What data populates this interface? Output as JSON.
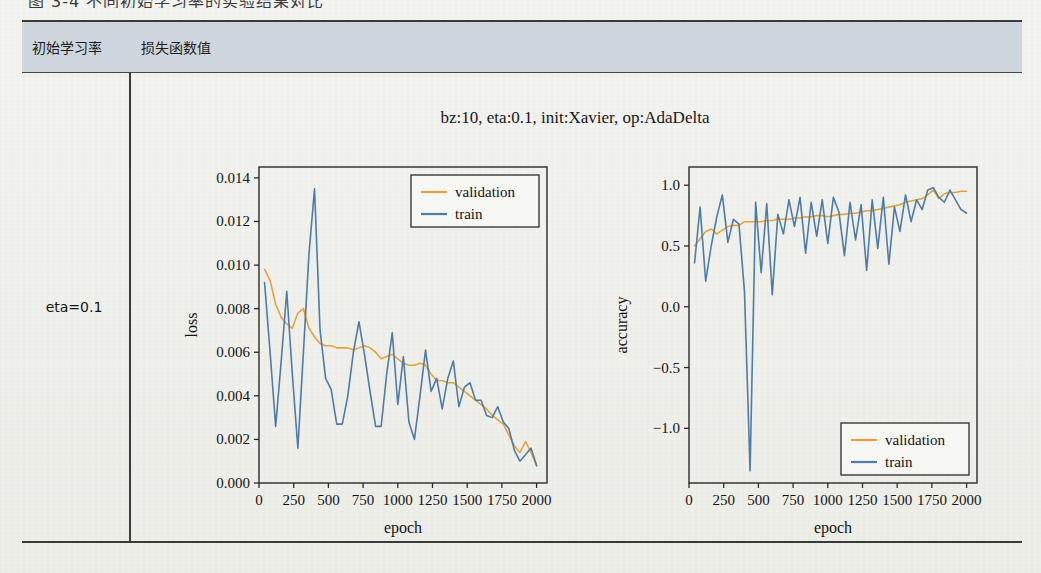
{
  "caption_partial": "图 3-4  不同初始学习率的实验结果对比",
  "table": {
    "headers": [
      "初始学习率",
      "损失函数值"
    ],
    "row_label": "eta=0.1"
  },
  "figure": {
    "title": "bz:10, eta:0.1, init:Xavier, op:AdaDelta"
  },
  "colors": {
    "validation": "#e3a33c",
    "train": "#4e7ca8",
    "header_bg": "#ccd6dc",
    "rule": "#3a3a3a",
    "page_bg": "#f2f2ee"
  },
  "chart_data": [
    {
      "type": "line",
      "id": "loss-chart",
      "title": "",
      "xlabel": "epoch",
      "ylabel": "loss",
      "xlim": [
        0,
        2075
      ],
      "ylim": [
        0,
        0.0145
      ],
      "xticks": [
        0,
        250,
        500,
        750,
        1000,
        1250,
        1500,
        1750,
        2000
      ],
      "yticks": [
        0.0,
        0.002,
        0.004,
        0.006,
        0.008,
        0.01,
        0.012,
        0.014
      ],
      "ytick_labels": [
        "0.000",
        "0.002",
        "0.004",
        "0.006",
        "0.008",
        "0.010",
        "0.012",
        "0.014"
      ],
      "grid": false,
      "legend_position": "upper-right",
      "legend": [
        "validation",
        "train"
      ],
      "x": [
        40,
        80,
        120,
        160,
        200,
        240,
        280,
        320,
        360,
        400,
        440,
        480,
        520,
        560,
        600,
        640,
        680,
        720,
        760,
        800,
        840,
        880,
        920,
        960,
        1000,
        1040,
        1080,
        1120,
        1160,
        1200,
        1240,
        1280,
        1320,
        1360,
        1400,
        1440,
        1480,
        1520,
        1560,
        1600,
        1640,
        1680,
        1720,
        1760,
        1800,
        1840,
        1880,
        1920,
        1960,
        2000
      ],
      "series": [
        {
          "name": "validation",
          "color": "#e3a33c",
          "values": [
            0.0098,
            0.0093,
            0.0082,
            0.0076,
            0.0073,
            0.0071,
            0.0078,
            0.008,
            0.0071,
            0.0067,
            0.0064,
            0.0063,
            0.0063,
            0.0062,
            0.0062,
            0.0062,
            0.0061,
            0.0062,
            0.0063,
            0.0062,
            0.006,
            0.0057,
            0.0058,
            0.0059,
            0.0057,
            0.0055,
            0.0054,
            0.0054,
            0.0055,
            0.0054,
            0.005,
            0.0047,
            0.0047,
            0.0046,
            0.0046,
            0.0044,
            0.0042,
            0.004,
            0.0038,
            0.0036,
            0.0034,
            0.0031,
            0.0029,
            0.0027,
            0.0022,
            0.0017,
            0.0014,
            0.0019,
            0.0014,
            0.0008
          ]
        },
        {
          "name": "train",
          "color": "#4e7ca8",
          "values": [
            0.0092,
            0.006,
            0.0026,
            0.0056,
            0.0088,
            0.005,
            0.0016,
            0.006,
            0.0105,
            0.0135,
            0.007,
            0.0048,
            0.0043,
            0.0027,
            0.0027,
            0.004,
            0.006,
            0.0074,
            0.0059,
            0.0042,
            0.0026,
            0.0026,
            0.005,
            0.0069,
            0.0036,
            0.0058,
            0.0028,
            0.002,
            0.004,
            0.0061,
            0.0042,
            0.0048,
            0.0034,
            0.0048,
            0.0056,
            0.0035,
            0.0044,
            0.0046,
            0.0038,
            0.0038,
            0.0031,
            0.003,
            0.0035,
            0.0028,
            0.0025,
            0.0015,
            0.001,
            0.0013,
            0.0016,
            0.0008
          ]
        }
      ]
    },
    {
      "type": "line",
      "id": "accuracy-chart",
      "title": "",
      "xlabel": "epoch",
      "ylabel": "accuracy",
      "xlim": [
        0,
        2075
      ],
      "ylim": [
        -1.45,
        1.15
      ],
      "xticks": [
        0,
        250,
        500,
        750,
        1000,
        1250,
        1500,
        1750,
        2000
      ],
      "yticks": [
        -1.0,
        -0.5,
        0.0,
        0.5,
        1.0
      ],
      "ytick_labels": [
        "−1.0",
        "−0.5",
        "0.0",
        "0.5",
        "1.0"
      ],
      "grid": false,
      "legend_position": "lower-right",
      "legend": [
        "validation",
        "train"
      ],
      "x": [
        40,
        80,
        120,
        160,
        200,
        240,
        280,
        320,
        360,
        400,
        440,
        480,
        520,
        560,
        600,
        640,
        680,
        720,
        760,
        800,
        840,
        880,
        920,
        960,
        1000,
        1040,
        1080,
        1120,
        1160,
        1200,
        1240,
        1280,
        1320,
        1360,
        1400,
        1440,
        1480,
        1520,
        1560,
        1600,
        1640,
        1680,
        1720,
        1760,
        1800,
        1840,
        1880,
        1920,
        1960,
        2000
      ],
      "series": [
        {
          "name": "validation",
          "color": "#e3a33c",
          "values": [
            0.5,
            0.56,
            0.62,
            0.64,
            0.6,
            0.63,
            0.66,
            0.67,
            0.67,
            0.7,
            0.7,
            0.7,
            0.7,
            0.71,
            0.71,
            0.72,
            0.72,
            0.72,
            0.73,
            0.73,
            0.74,
            0.74,
            0.75,
            0.75,
            0.74,
            0.75,
            0.76,
            0.76,
            0.77,
            0.77,
            0.78,
            0.79,
            0.79,
            0.8,
            0.81,
            0.82,
            0.83,
            0.84,
            0.86,
            0.87,
            0.88,
            0.89,
            0.92,
            0.96,
            0.89,
            0.93,
            0.94,
            0.94,
            0.95,
            0.95
          ]
        },
        {
          "name": "train",
          "color": "#4e7ca8",
          "values": [
            0.36,
            0.82,
            0.21,
            0.5,
            0.74,
            0.92,
            0.53,
            0.72,
            0.68,
            0.12,
            -1.35,
            0.86,
            0.28,
            0.85,
            0.1,
            0.76,
            0.6,
            0.88,
            0.66,
            0.9,
            0.44,
            0.86,
            0.58,
            0.88,
            0.52,
            0.9,
            0.78,
            0.42,
            0.86,
            0.55,
            0.84,
            0.3,
            0.88,
            0.48,
            0.9,
            0.35,
            0.82,
            0.62,
            0.92,
            0.7,
            0.88,
            0.8,
            0.96,
            0.98,
            0.9,
            0.86,
            0.96,
            0.88,
            0.8,
            0.77
          ]
        }
      ]
    }
  ]
}
